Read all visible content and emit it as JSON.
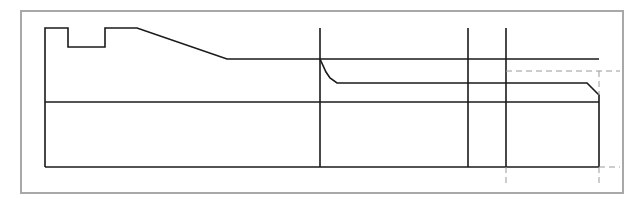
{
  "diagram": {
    "type": "technical-drawing",
    "colors": {
      "background": "#ffffff",
      "frame": "#a8a8a8",
      "solid_line": "#1a1a1a",
      "dashed_line": "#9a9a9a"
    },
    "frame": {
      "x": 21,
      "y": 11,
      "width": 602,
      "height": 182
    },
    "outline_points": "45,167 45,28 68,28 68,47 105,47 105,28 137,28 227,59 599,59",
    "horizontal_lines": [
      {
        "name": "lower-axis-line",
        "x1": 45,
        "y1": 102,
        "x2": 599,
        "y2": 102
      },
      {
        "name": "bottom-line",
        "x1": 45,
        "y1": 167,
        "x2": 599,
        "y2": 167
      }
    ],
    "inner_profile_points": "320,59 326,72 330,78 337,83 587,83 599,95 599,167",
    "vertical_lines": [
      {
        "name": "section-line-1",
        "x": 320,
        "y1": 28,
        "y2": 167
      },
      {
        "name": "section-line-2",
        "x": 468,
        "y1": 28,
        "y2": 167
      },
      {
        "name": "section-line-3",
        "x": 506,
        "y1": 28,
        "y2": 167
      }
    ],
    "dashed_lines": [
      {
        "name": "hidden-line-upper",
        "x1": 506,
        "y1": 71,
        "x2": 620,
        "y2": 71
      },
      {
        "name": "hidden-line-right-upper",
        "x1": 599,
        "y1": 71,
        "x2": 599,
        "y2": 95
      },
      {
        "name": "extension-line-bottom-right",
        "x1": 599,
        "y1": 167,
        "x2": 620,
        "y2": 167
      },
      {
        "name": "extension-line-below-1",
        "x1": 506,
        "y1": 167,
        "x2": 506,
        "y2": 186
      },
      {
        "name": "extension-line-below-2",
        "x1": 599,
        "y1": 167,
        "x2": 599,
        "y2": 186
      }
    ]
  }
}
